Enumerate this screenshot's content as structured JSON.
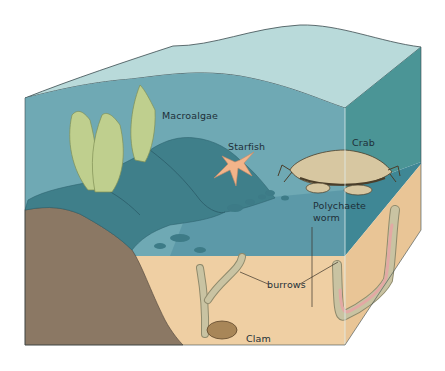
{
  "diagram": {
    "labels": {
      "macroalgae": "Macroalgae",
      "starfish": "Starfish",
      "crab": "Crab",
      "polychaete_line1": "Polychaete",
      "polychaete_line2": "worm",
      "burrows": "burrows",
      "clam": "Clam"
    },
    "colors": {
      "water_top": "#b9dada",
      "water_front": "#6fa9b4",
      "water_right": "#4b9596",
      "deep_water_front": "#4e8ea0",
      "rock": "#3f7f8a",
      "rock_dark": "#346e7a",
      "sediment": "#efcfa3",
      "sediment_right": "#e9c596",
      "bedrock": "#8b7864",
      "algae": "#bfcf8e",
      "starfish": "#f2b48a",
      "crab": "#d7c7a1",
      "burrow": "#c9c3a2",
      "worm": "#e3a9a4",
      "clam": "#a88658",
      "outline": "#2c3a3e"
    }
  }
}
